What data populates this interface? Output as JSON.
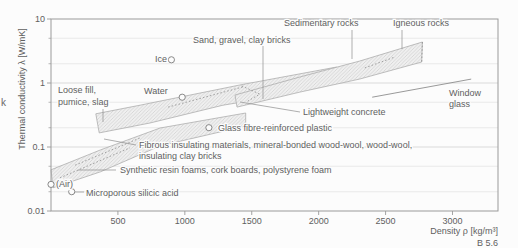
{
  "figure": {
    "stray_left_text": "k",
    "caption": "B 5.6"
  },
  "colors": {
    "text": "#5f5f5f",
    "frame": "#9a9a9a",
    "grid_minor": "#e4e4e4",
    "grid_major": "#d7d7d7",
    "leader": "#8d8d8d",
    "band_stroke": "#a5a5a5",
    "band_fill": "#efefef",
    "hatch": "#c9c9c9",
    "marker": "#7c7c7c",
    "halo": "#fcfcfc"
  },
  "chart_data": {
    "type": "scatter",
    "title": "",
    "xlabel": "Density ρ [kg/m³]",
    "ylabel": "Thermal conductivity λ [W/mK]",
    "x_axis": {
      "min": 0,
      "max": 3340,
      "ticks": [
        500,
        1000,
        1500,
        2000,
        2500,
        3000
      ]
    },
    "y_axis": {
      "scale": "log",
      "min": 0.01,
      "max": 10,
      "major_ticks": [
        0.01,
        0.1,
        1,
        10
      ],
      "gridlines_minor": [
        0.02,
        0.05,
        0.2,
        0.5,
        2,
        5
      ],
      "gridlines_major": [
        0.1,
        1
      ]
    },
    "points": [
      {
        "name": "ice",
        "label": "Ice",
        "rho": 900,
        "lambda": 2.3
      },
      {
        "name": "water",
        "label": "Water",
        "rho": 980,
        "lambda": 0.6
      },
      {
        "name": "glass-fibre-reinforced-plastic",
        "label": "Glass fibre-reinforced plastic",
        "rho": 1180,
        "lambda": 0.2
      },
      {
        "name": "air",
        "label": "(Air)",
        "rho": 0,
        "lambda": 0.026
      },
      {
        "name": "microporous-silicic-acid",
        "label": "Microporous silicic acid",
        "rho": 155,
        "lambda": 0.02
      }
    ],
    "regions": [
      {
        "name": "insulating-materials-band",
        "label": "Fibrous insulating materials, mineral-bonded wood-wool, wood-wool, insulating clay bricks / Synthetic resin foams, cork boards, polystyrene foam",
        "vertices": [
          [
            0,
            0.044
          ],
          [
            370,
            0.09
          ],
          [
            815,
            0.198
          ],
          [
            1455,
            0.34
          ],
          [
            1455,
            0.213
          ],
          [
            815,
            0.104
          ],
          [
            370,
            0.041
          ],
          [
            15,
            0.023
          ]
        ]
      },
      {
        "name": "loose-fill-sand-gravel-clay-band",
        "label": "Loose fill, pumice, slag / Sand, gravel, clay bricks / Lightweight concrete",
        "vertices": [
          [
            335,
            0.33
          ],
          [
            665,
            0.45
          ],
          [
            1410,
            0.93
          ],
          [
            2135,
            1.78
          ],
          [
            2135,
            1.11
          ],
          [
            1560,
            0.56
          ],
          [
            1285,
            0.45
          ],
          [
            740,
            0.237
          ],
          [
            360,
            0.166
          ]
        ]
      },
      {
        "name": "rocks-band",
        "label": "Sedimentary rocks / Igneous rocks",
        "vertices": [
          [
            1375,
            0.65
          ],
          [
            1860,
            1.24
          ],
          [
            2305,
            2.2
          ],
          [
            2775,
            4.37
          ],
          [
            2770,
            2.13
          ],
          [
            2305,
            1.15
          ],
          [
            1860,
            0.72
          ],
          [
            1390,
            0.42
          ]
        ]
      }
    ],
    "lines": [
      {
        "name": "window-glass-line",
        "label": "Window glass",
        "points": [
          [
            2400,
            0.6
          ],
          [
            3140,
            1.15
          ]
        ]
      }
    ],
    "dashed_lines": [
      {
        "name": "sand-band-inner-dash",
        "points": [
          [
            875,
            0.42
          ],
          [
            1435,
            0.87
          ]
        ]
      },
      {
        "name": "sand-band-hook-dash",
        "points": [
          [
            1425,
            0.9
          ],
          [
            1560,
            0.67
          ],
          [
            1470,
            0.52
          ]
        ]
      },
      {
        "name": "igneous-right-edge-dash",
        "points": [
          [
            2775,
            4.37
          ],
          [
            2770,
            2.13
          ]
        ]
      },
      {
        "name": "sedimentary-igneous-overlap-dash",
        "points": [
          [
            2345,
            1.72
          ],
          [
            2570,
            2.55
          ]
        ]
      },
      {
        "name": "insulation-inner-dash-1",
        "points": [
          [
            67,
            0.033
          ],
          [
            590,
            0.097
          ]
        ]
      },
      {
        "name": "insulation-inner-dash-2",
        "points": [
          [
            180,
            0.052
          ],
          [
            665,
            0.138
          ]
        ]
      }
    ],
    "leaders_px": [
      {
        "name": "sand-gravel-leader",
        "pts": [
          [
            263,
            46
          ],
          [
            263,
            99
          ]
        ]
      },
      {
        "name": "sedimentary-leader",
        "pts": [
          [
            352,
            30
          ],
          [
            352,
            59
          ]
        ]
      },
      {
        "name": "igneous-leader",
        "pts": [
          [
            402,
            30
          ],
          [
            402,
            49
          ]
        ]
      },
      {
        "name": "loose-fill-leader",
        "pts": [
          [
            103,
            109
          ],
          [
            103,
            122
          ]
        ]
      },
      {
        "name": "lightweight-concrete-leader",
        "pts": [
          [
            240,
            102
          ],
          [
            300,
            112
          ]
        ]
      },
      {
        "name": "fibrous-leader",
        "pts": [
          [
            104,
            139
          ],
          [
            136,
            145
          ]
        ]
      },
      {
        "name": "synthetic-foams-leader",
        "pts": [
          [
            78,
            170
          ],
          [
            116,
            170
          ]
        ]
      },
      {
        "name": "microporous-leader",
        "pts": [
          [
            75,
            192
          ],
          [
            84,
            192
          ]
        ]
      }
    ],
    "labels_px": [
      {
        "name": "sand-gravel-label",
        "text": "Sand, gravel, clay bricks",
        "x": 193,
        "y": 43
      },
      {
        "name": "sedimentary-label",
        "text": "Sedimentary rocks",
        "x": 284,
        "y": 26
      },
      {
        "name": "igneous-label",
        "text": "Igneous rocks",
        "x": 393,
        "y": 26
      },
      {
        "name": "ice-label",
        "text": "Ice",
        "x": 155,
        "y": 62
      },
      {
        "name": "water-label",
        "text": "Water",
        "x": 144,
        "y": 94
      },
      {
        "name": "loose-fill-label-1",
        "text": "Loose fill,",
        "x": 58,
        "y": 93
      },
      {
        "name": "loose-fill-label-2",
        "text": "pumice, slag",
        "x": 58,
        "y": 105
      },
      {
        "name": "window-glass-label-1",
        "text": "Window",
        "x": 449,
        "y": 96
      },
      {
        "name": "window-glass-label-2",
        "text": "glass",
        "x": 449,
        "y": 107
      },
      {
        "name": "lightweight-concrete-label",
        "text": "Lightweight concrete",
        "x": 303,
        "y": 115
      },
      {
        "name": "glass-fibre-label",
        "text": "Glass fibre-reinforced plastic",
        "x": 218,
        "y": 131
      },
      {
        "name": "fibrous-label-1",
        "text": "Fibrous insulating materials, mineral-bonded wood-wool, wood-wool,",
        "x": 139,
        "y": 148
      },
      {
        "name": "fibrous-label-2",
        "text": "insulating clay bricks",
        "x": 139,
        "y": 159
      },
      {
        "name": "synthetic-foams-label",
        "text": "Synthetic resin foams, cork boards, polystyrene foam",
        "x": 120,
        "y": 173
      },
      {
        "name": "air-label",
        "text": "(Air)",
        "x": 56,
        "y": 187
      },
      {
        "name": "microporous-label",
        "text": "Microporous silicic acid",
        "x": 86,
        "y": 196
      }
    ]
  }
}
